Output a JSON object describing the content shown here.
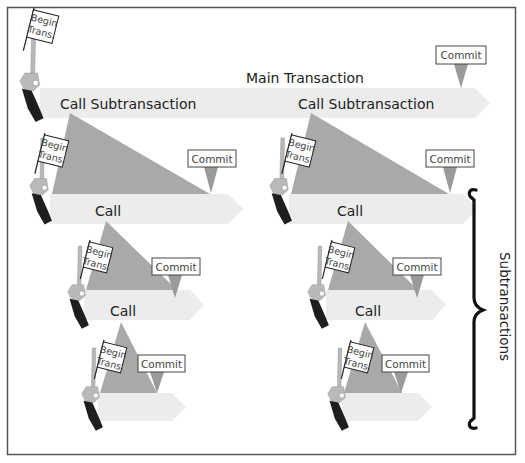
{
  "figure": {
    "main_label": "Main Transaction",
    "side_label": "Subtransactions",
    "flag_line1": "Begin",
    "flag_line2": "Trans.",
    "commit_label": "Commit",
    "call_sub_label": "Call Subtransaction",
    "call_label": "Call"
  },
  "colors": {
    "frame": "#555555",
    "arrow": "#ececec",
    "triangle": "#a9a9a9",
    "pointer": "#9a9a9a",
    "gun_body": "#b5b5b5",
    "gun_grip": "#1e1e1e",
    "brace": "#111111"
  },
  "columns": [
    {
      "name": "left",
      "levels": [
        {
          "label_key": "call_sub_label"
        },
        {
          "label_key": "call_label"
        },
        {
          "label_key": "call_label"
        },
        {
          "label_key": null
        }
      ]
    },
    {
      "name": "right",
      "levels": [
        {
          "label_key": "call_sub_label"
        },
        {
          "label_key": "call_label"
        },
        {
          "label_key": "call_label"
        },
        {
          "label_key": null
        }
      ]
    }
  ]
}
